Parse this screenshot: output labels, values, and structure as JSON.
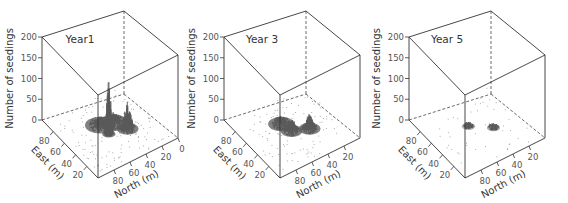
{
  "chart_data": [
    {
      "type": "surface3d",
      "title": "Year1",
      "xlabel": "East (m)",
      "ylabel": "North (m)",
      "zlabel": "Number of seedings",
      "z_ticks": [
        0,
        50,
        100,
        150,
        200
      ],
      "east_ticks": [
        20,
        40,
        60,
        80
      ],
      "north_ticks": [
        0,
        20,
        40,
        60,
        80
      ],
      "zlim": [
        0,
        200
      ],
      "peaks": [
        {
          "east": 45,
          "north": 55,
          "height": 150,
          "spread": 3
        },
        {
          "east": 40,
          "north": 35,
          "height": 70,
          "spread": 5
        },
        {
          "east": 60,
          "north": 55,
          "height": 20,
          "spread": 7
        },
        {
          "east": 55,
          "north": 42,
          "height": 25,
          "spread": 7
        }
      ],
      "scatter_density": 140
    },
    {
      "type": "surface3d",
      "title": "Year 3",
      "xlabel": "East (m)",
      "ylabel": "North (m)",
      "zlabel": "Number of seedings",
      "z_ticks": [
        0,
        50,
        100,
        150,
        200
      ],
      "east_ticks": [
        20,
        40,
        60,
        80
      ],
      "north_ticks": [
        20,
        40,
        60,
        80
      ],
      "zlim": [
        0,
        200
      ],
      "peaks": [
        {
          "east": 40,
          "north": 35,
          "height": 40,
          "spread": 5
        },
        {
          "east": 48,
          "north": 52,
          "height": 35,
          "spread": 5
        },
        {
          "east": 62,
          "north": 55,
          "height": 18,
          "spread": 6
        }
      ],
      "scatter_density": 110
    },
    {
      "type": "surface3d",
      "title": "Year 5",
      "xlabel": "East (m)",
      "ylabel": "North (m)",
      "zlabel": "Number of seedings",
      "z_ticks": [
        0,
        50,
        100,
        150,
        200
      ],
      "east_ticks": [
        20,
        40,
        60,
        80
      ],
      "north_ticks": [
        20,
        40,
        60,
        80
      ],
      "zlim": [
        0,
        200
      ],
      "peaks": [
        {
          "east": 42,
          "north": 35,
          "height": 8,
          "spread": 3
        },
        {
          "east": 58,
          "north": 55,
          "height": 8,
          "spread": 3
        }
      ],
      "scatter_density": 45
    }
  ],
  "panels": [
    {
      "title": "Year1",
      "z_label": "Number of seedings",
      "east_label": "East (m)",
      "north_label": "North (m)"
    },
    {
      "title": "Year 3",
      "z_label": "Number of seedings",
      "east_label": "East (m)",
      "north_label": "North (m)"
    },
    {
      "title": "Year 5",
      "z_label": "Number of seedings",
      "east_label": "East (m)",
      "north_label": "North (m)"
    }
  ],
  "colors": {
    "surface": "#5a5a5a",
    "scatter": "#9a9a9a",
    "edges": "#333333"
  }
}
